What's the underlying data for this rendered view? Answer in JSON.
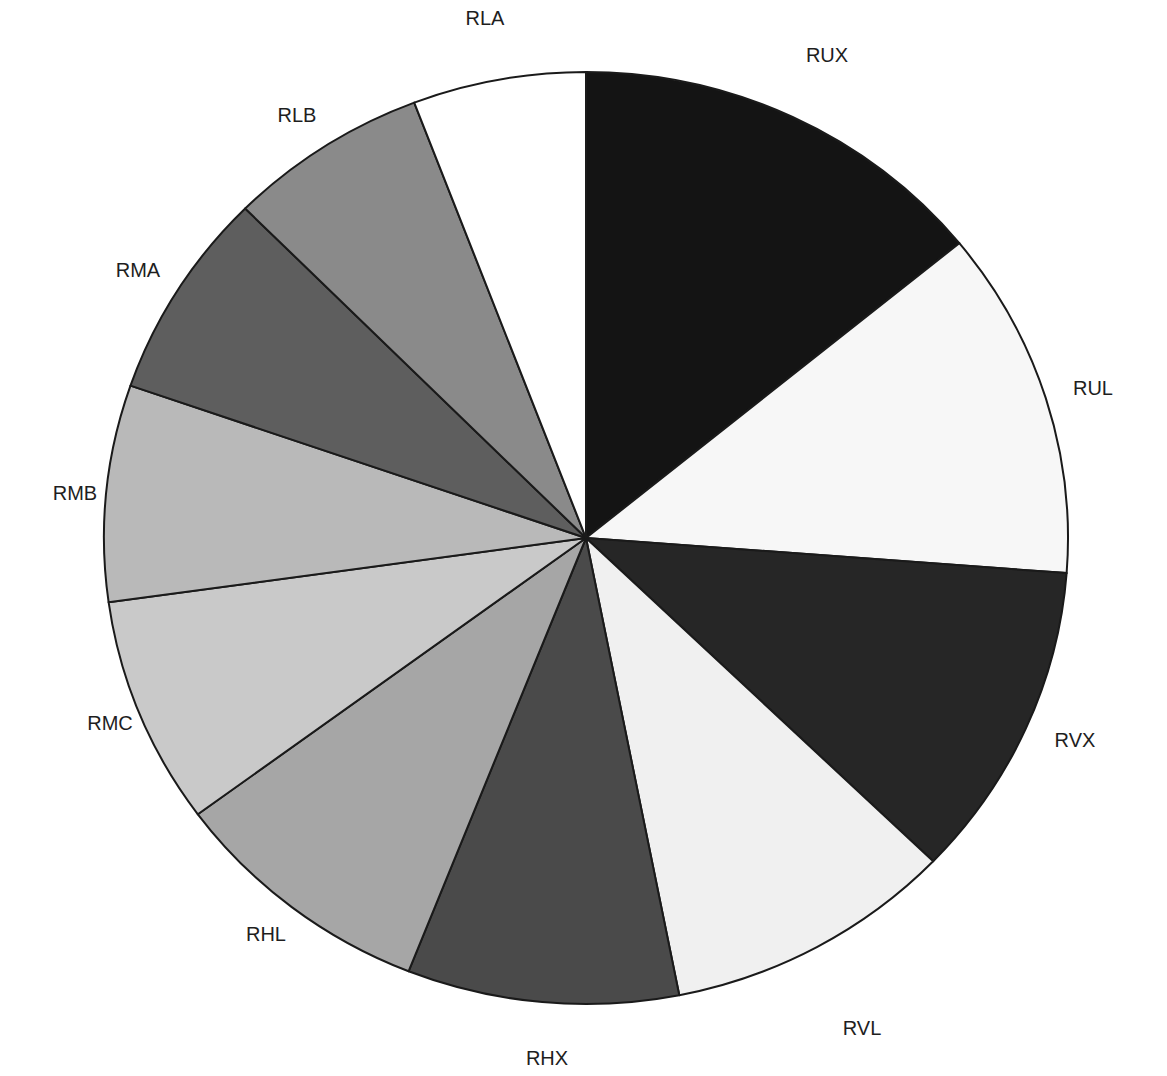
{
  "chart_data": {
    "type": "pie",
    "title": "",
    "start_angle_deg": 0,
    "direction": "clockwise",
    "legend": "none (labels placed outside slices)",
    "categories": [
      "RUX",
      "RUL",
      "RVX",
      "RVL",
      "RHX",
      "RHL",
      "RMC",
      "RMB",
      "RMA",
      "RLB",
      "RLA"
    ],
    "values": [
      14.1,
      12.1,
      11.0,
      9.7,
      9.1,
      8.9,
      7.9,
      7.5,
      7.2,
      6.7,
      5.8
    ],
    "unit": "percent (estimated from slice angles)",
    "colors": [
      "#141414",
      "#f7f7f7",
      "#262626",
      "#f0f0f0",
      "#4a4a4a",
      "#a6a6a6",
      "#c9c9c9",
      "#b9b9b9",
      "#5e5e5e",
      "#8a8a8a",
      "#ffffff"
    ],
    "label_positions": [
      [
        827,
        55
      ],
      [
        1093,
        388
      ],
      [
        1075,
        740
      ],
      [
        862,
        1028
      ],
      [
        547,
        1058
      ],
      [
        266,
        934
      ],
      [
        110,
        723
      ],
      [
        75,
        493
      ],
      [
        138,
        270
      ],
      [
        297,
        115
      ],
      [
        485,
        18
      ]
    ]
  },
  "geometry": {
    "cx": 586,
    "cy": 538,
    "rx": 482,
    "ry": 466
  }
}
